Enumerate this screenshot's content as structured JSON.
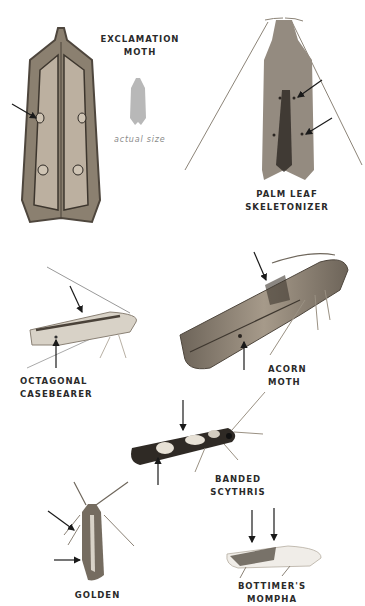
{
  "page": {
    "species": [
      {
        "id": "exclamation",
        "label_lines": [
          "EXCLAMATION",
          "MOTH"
        ]
      },
      {
        "id": "palm-leaf",
        "label_lines": [
          "PALM LEAF",
          "SKELETONIZER"
        ]
      },
      {
        "id": "octagonal",
        "label_lines": [
          "OCTAGONAL CASEBEARER"
        ]
      },
      {
        "id": "acorn",
        "label_lines": [
          "ACORN MOTH"
        ]
      },
      {
        "id": "banded",
        "label_lines": [
          "BANDED",
          "SCYTHRIS"
        ]
      },
      {
        "id": "golden",
        "label_lines": [
          "GOLDEN"
        ]
      },
      {
        "id": "bottimer",
        "label_lines": [
          "BOTTIMER'S MOMPHA"
        ]
      }
    ],
    "actual_size_caption": "actual size",
    "colors": {
      "background": "#ffffff",
      "label_text": "#2a2a2a",
      "caption_text": "#8a8a8a",
      "silhouette": "#b8b8b8",
      "arrow": "#1a1a1a"
    }
  }
}
